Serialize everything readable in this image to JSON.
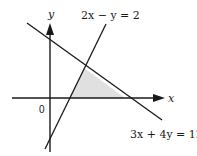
{
  "diagram": {
    "axes": {
      "x_label": "x",
      "y_label": "y",
      "origin_label": "0"
    },
    "lines": [
      {
        "equation": "2x − y = 2",
        "label": "2x − y = 2"
      },
      {
        "equation": "3x + 4y = 12",
        "label": "3x + 4y = 12"
      }
    ],
    "shaded_region": {
      "description": "Triangle bounded by 2x − y = 2, 3x + 4y = 12 and the x-axis",
      "fill": "#e0e0e0"
    },
    "colors": {
      "line": "#1a1a1a",
      "shade": "#e0e0e0",
      "background": "#ffffff"
    }
  }
}
